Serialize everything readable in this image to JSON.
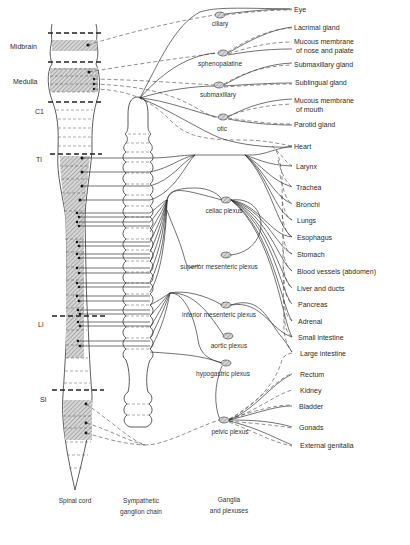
{
  "diagram": {
    "columns": {
      "spinal_cord": "Spinal cord",
      "chain_line1": "Sympathetic",
      "chain_line2": "ganglion chain",
      "ganglia_line1": "Ganglia",
      "ganglia_line2": "and plexuses"
    },
    "cord_levels": [
      {
        "label": "Midbrain"
      },
      {
        "label": "Medulla"
      },
      {
        "label": "C1"
      },
      {
        "label": "Tl"
      },
      {
        "label": "Ll"
      },
      {
        "label": "Sl"
      }
    ],
    "ganglia": [
      {
        "label": "ciliary"
      },
      {
        "label": "sphenopalatine"
      },
      {
        "label": "submaxillary"
      },
      {
        "label": "otic"
      },
      {
        "label": "celiac plexus"
      },
      {
        "label": "superior mesenteric plexus"
      },
      {
        "label": "inferior mesenteric plexus"
      },
      {
        "label": "aortic plexus"
      },
      {
        "label": "hypogastric plexus"
      },
      {
        "label": "pelvic plexus"
      }
    ],
    "organs": [
      {
        "label": "Eye"
      },
      {
        "label": "Lacrimal gland"
      },
      {
        "label": "Mucous membrane",
        "label2": "of nose and palate"
      },
      {
        "label": "Submaxillary  gland"
      },
      {
        "label": "Sublingual  gland"
      },
      {
        "label": "Mucous membrane",
        "label2": "of  mouth"
      },
      {
        "label": "Parotid gland"
      },
      {
        "label": "Heart"
      },
      {
        "label": "Larynx"
      },
      {
        "label": "Trachea"
      },
      {
        "label": "Bronchi"
      },
      {
        "label": "Lungs"
      },
      {
        "label": "Esophagus"
      },
      {
        "label": "Stomach"
      },
      {
        "label": "Blood vessels (abdomen)"
      },
      {
        "label": "Liver and ducts"
      },
      {
        "label": "Pancreas"
      },
      {
        "label": "Adrenal"
      },
      {
        "label": "Small intestine"
      },
      {
        "label": "Large intestine"
      },
      {
        "label": "Rectum"
      },
      {
        "label": "Kidney"
      },
      {
        "label": "Bladder"
      },
      {
        "label": "Gonads"
      },
      {
        "label": "External genitalia"
      }
    ],
    "legend": {
      "solid_line": "sympathetic fibers",
      "dashed_line": "parasympathetic fibers"
    }
  }
}
